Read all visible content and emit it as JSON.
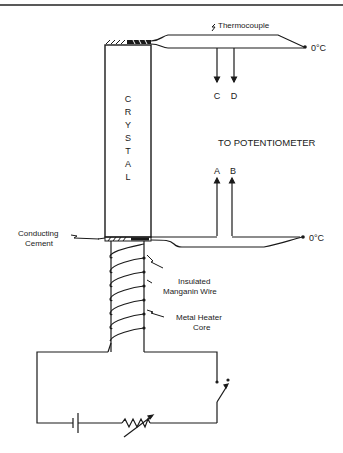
{
  "diagram": {
    "type": "apparatus-schematic",
    "labels": {
      "thermocouple": "Thermocouple",
      "crystal_letters": [
        "C",
        "R",
        "Y",
        "S",
        "T",
        "A",
        "L"
      ],
      "potentiometer": "TO POTENTIOMETER",
      "terminal_c": "C",
      "terminal_d": "D",
      "terminal_a": "A",
      "terminal_b": "B",
      "ref_top": "0°C",
      "ref_bottom": "0°C",
      "conducting_cement_1": "Conducting",
      "conducting_cement_2": "Cement",
      "manganin_1": "Insulated",
      "manganin_2": "Manganin Wire",
      "heater_1": "Metal Heater",
      "heater_2": "Core"
    },
    "components": [
      {
        "name": "crystal",
        "kind": "rectangle"
      },
      {
        "name": "top-thermocouple",
        "kind": "wire-pair",
        "terminals": [
          "C",
          "D"
        ]
      },
      {
        "name": "bottom-thermocouple",
        "kind": "wire-pair",
        "terminals": [
          "A",
          "B"
        ]
      },
      {
        "name": "heater-core",
        "kind": "coil"
      },
      {
        "name": "battery",
        "kind": "cell"
      },
      {
        "name": "rheostat",
        "kind": "variable-resistor"
      },
      {
        "name": "switch",
        "kind": "switch-open"
      }
    ],
    "colors": {
      "ink": "#1a1a1a",
      "background": "#ffffff"
    }
  }
}
